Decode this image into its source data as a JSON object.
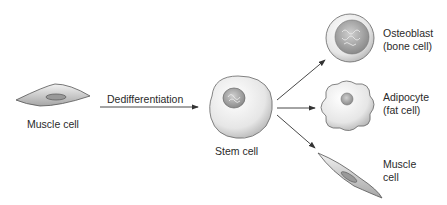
{
  "diagram": {
    "source_cell": {
      "label": "Muscle cell"
    },
    "process_arrow": {
      "label": "Dedifferentiation"
    },
    "stem_cell": {
      "label": "Stem cell"
    },
    "outcomes": [
      {
        "line1": "Osteoblast",
        "line2": "(bone cell)"
      },
      {
        "line1": "Adipocyte",
        "line2": "(fat cell)"
      },
      {
        "line1": "Muscle",
        "line2": "cell"
      }
    ],
    "colors": {
      "outline": "#555555",
      "fill_light": "#ececec",
      "fill_dark": "#a8a8a8",
      "arrow": "#333333"
    }
  }
}
